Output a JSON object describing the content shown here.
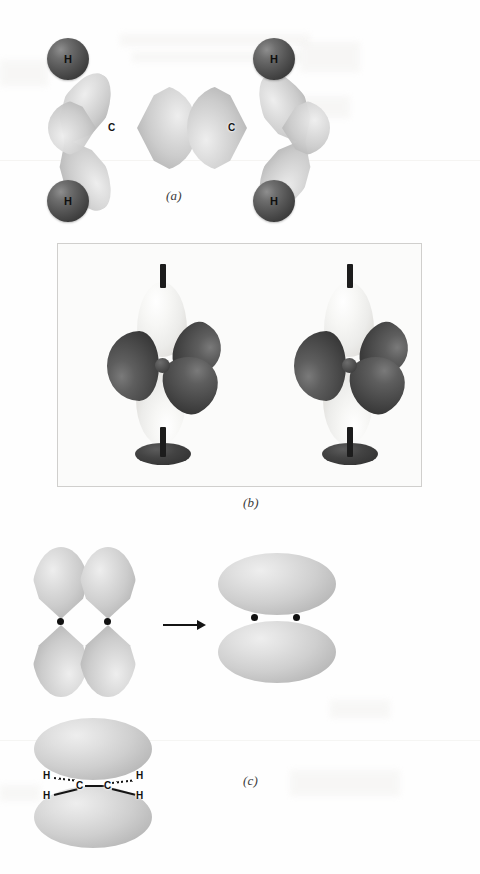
{
  "figure": {
    "background_color": "#fefefe"
  },
  "panels": [
    {
      "id": "a",
      "caption": "(a)",
      "description": "sp2 hybrid orbital sigma-bond framework of ethylene",
      "atoms": {
        "hydrogen_label": "H",
        "carbon_label": "C",
        "hydrogen_count": 4,
        "carbon_count": 2
      },
      "hydrogens": [
        {
          "label": "H",
          "position": "top-left"
        },
        {
          "label": "H",
          "position": "top-right"
        },
        {
          "label": "H",
          "position": "bottom-left"
        },
        {
          "label": "H",
          "position": "bottom-right"
        }
      ],
      "carbons": [
        {
          "label": "C",
          "position": "left"
        },
        {
          "label": "C",
          "position": "right"
        }
      ],
      "colors": {
        "hydrogen_sphere": "#3e3e3e",
        "orbital_lobe": "#cccccc"
      }
    },
    {
      "id": "b",
      "caption": "(b)",
      "description": "Two physical molecular models of sp2-hybridized carbon, each with three dark sp2 lobes in a plane and one light p orbital perpendicular",
      "model_count": 2,
      "lobes_per_model": {
        "sp2_dark": 3,
        "p_light": 2
      },
      "colors": {
        "sp2_lobe": "#4a4a4a",
        "p_lobe": "#f0efec",
        "stand": "#2d2d2d",
        "frame_border": "#d0cfcd"
      }
    },
    {
      "id": "c",
      "caption": "(c)",
      "description": "Side-by-side p orbitals overlap to form the pi bond of the carbon-carbon double bond",
      "steps": [
        {
          "name": "two-adjacent-p-orbitals",
          "nucleus_dots": 2
        },
        {
          "name": "pi-bond-cloud",
          "nucleus_dots": 2
        }
      ],
      "skeleton": {
        "atoms": [
          {
            "label": "H",
            "position": "upper-left",
            "bond_style": "hashed"
          },
          {
            "label": "H",
            "position": "lower-left",
            "bond_style": "solid"
          },
          {
            "label": "C",
            "position": "left"
          },
          {
            "label": "C",
            "position": "right"
          },
          {
            "label": "H",
            "position": "upper-right",
            "bond_style": "hashed"
          },
          {
            "label": "H",
            "position": "lower-right",
            "bond_style": "solid"
          }
        ],
        "cc_bond_style": "solid"
      },
      "colors": {
        "pi_cloud": "#cfcfcf",
        "nucleus_dot": "#111111",
        "bond": "#141414",
        "arrow": "#141414"
      }
    }
  ]
}
